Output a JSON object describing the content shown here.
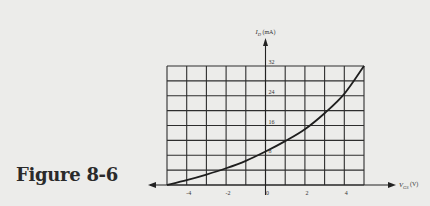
{
  "caption": "Figure 8-6",
  "chart_data": {
    "type": "line",
    "title": "",
    "xlabel": "V_GS (V)",
    "ylabel": "I_D (mA)",
    "x_axis": {
      "symbol": "V",
      "subscript": "GS",
      "unit": "(V)",
      "range": [
        -5,
        5
      ],
      "tick_labels": [
        "-4",
        "-2",
        "0",
        "2",
        "4"
      ]
    },
    "y_axis": {
      "symbol": "I",
      "subscript": "D",
      "unit": "(mA)",
      "range": [
        0,
        32
      ],
      "tick_labels": [
        "8",
        "16",
        "24",
        "32"
      ]
    },
    "grid": true,
    "grid_columns": 10,
    "grid_rows": 8,
    "series": [
      {
        "name": "transfer characteristic",
        "x": [
          -5,
          -4,
          -3,
          -2,
          -1,
          0,
          1,
          2,
          3,
          4,
          5
        ],
        "y": [
          0,
          1.3,
          2.8,
          4.5,
          6.5,
          9,
          11.8,
          15,
          19.3,
          24.5,
          32
        ]
      }
    ]
  }
}
